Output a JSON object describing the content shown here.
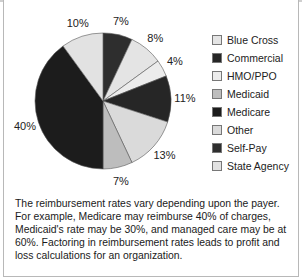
{
  "chart_data": {
    "type": "pie",
    "title": "",
    "start_angle_deg": 0,
    "direction": "clockwise",
    "slices": [
      {
        "label": "Self-Pay",
        "value": 7,
        "display": "7%",
        "color": "#2e2e2e"
      },
      {
        "label": "Blue Cross",
        "value": 8,
        "display": "8%",
        "color": "#e4e4e4"
      },
      {
        "label": "HMO/PPO",
        "value": 4,
        "display": "4%",
        "color": "#ececec"
      },
      {
        "label": "Commercial",
        "value": 11,
        "display": "11%",
        "color": "#262626"
      },
      {
        "label": "Other",
        "value": 13,
        "display": "13%",
        "color": "#dadada"
      },
      {
        "label": "Medicaid",
        "value": 7,
        "display": "7%",
        "color": "#bdbdbd"
      },
      {
        "label": "Medicare",
        "value": 40,
        "display": "40%",
        "color": "#1c1c1c"
      },
      {
        "label": "State Agency",
        "value": 10,
        "display": "10%",
        "color": "#e2e2e2"
      }
    ],
    "legend": {
      "placement": "right",
      "entries": [
        {
          "label": "Blue Cross",
          "color": "#e4e4e4"
        },
        {
          "label": "Commercial",
          "color": "#262626"
        },
        {
          "label": "HMO/PPO",
          "color": "#ececec"
        },
        {
          "label": "Medicaid",
          "color": "#bdbdbd"
        },
        {
          "label": "Medicare",
          "color": "#1c1c1c"
        },
        {
          "label": "Other",
          "color": "#dadada"
        },
        {
          "label": "Self-Pay",
          "color": "#2e2e2e"
        },
        {
          "label": "State Agency",
          "color": "#e2e2e2"
        }
      ]
    }
  },
  "caption": "The reimbursement rates vary depending upon the payer. For example, Medicare may reimburse 40% of charges, Medicaid's rate may be 30%, and managed care may be at 60%. Factoring in reimbursement rates leads to profit and loss calculations for an organization."
}
